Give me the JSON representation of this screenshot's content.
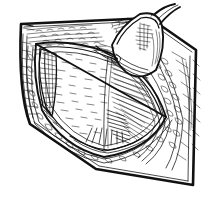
{
  "figure": {
    "style": "pen-and-ink engraving line art",
    "medium": "black line art on white background",
    "background_color": "#ffffff",
    "ink_color": "#111111",
    "canvas": {
      "width": 212,
      "height": 207
    },
    "caption": "",
    "labels": [],
    "parts": [
      {
        "id": "outer-skin-border",
        "name": "outer skin margin",
        "description": "heavy curved quadrilateral outline enclosing the field"
      },
      {
        "id": "upper-skin-flap",
        "name": "upper skin surface",
        "description": "hatched skin surface across the top of the field"
      },
      {
        "id": "incision-opening",
        "name": "open incision",
        "description": "lens-shaped central opening"
      },
      {
        "id": "wound-cavity",
        "name": "wound cavity",
        "description": "pale interior of the opened wound with stipple hatching"
      },
      {
        "id": "retractor-flap",
        "name": "retracted tissue flap",
        "description": "tongue-shaped flap lifted at the upper right"
      },
      {
        "id": "subcutaneous-layer",
        "name": "subcutaneous fat layer",
        "description": "scalloped cobblestone texture along the wound margin"
      },
      {
        "id": "muscle-fibers",
        "name": "muscle fiber striations",
        "description": "dense parallel hatching at the right of the cavity"
      }
    ]
  }
}
